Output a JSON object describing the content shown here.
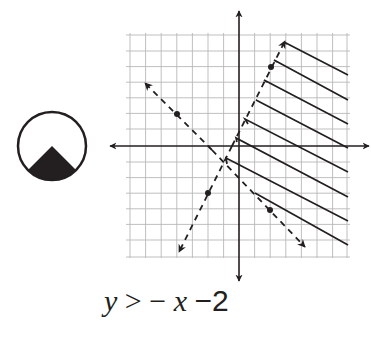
{
  "diagram": {
    "type": "graph-of-linear-inequality",
    "inequality_label": {
      "y": "y",
      "op": ">",
      "neg": "−",
      "x": "x",
      "minus_two": "−2"
    },
    "grid": {
      "cols": 14,
      "rows": 14,
      "line_color": "#b8b8b8"
    },
    "axes_color": "#231f20",
    "lines": [
      {
        "name": "boundary-line-1",
        "style": "dashed",
        "points_marked": 2
      },
      {
        "name": "boundary-line-2",
        "style": "dashed",
        "points_marked": 2
      }
    ],
    "shading": {
      "style": "hatched",
      "region": "right-of-both-lines"
    },
    "icon": {
      "name": "circle-with-filled-triangle-icon"
    }
  }
}
